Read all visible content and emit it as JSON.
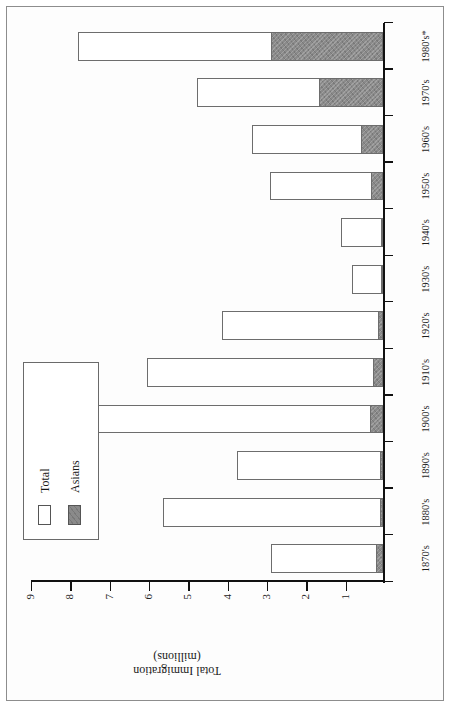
{
  "chart_data": {
    "type": "bar",
    "orientation": "rotated-90ccw",
    "title": "",
    "xlabel": "Decades",
    "ylabel": "Total Immigration (millions)",
    "ylabel_line1": "Total Immigration",
    "ylabel_line2": "(millions)",
    "ylim": [
      0,
      9
    ],
    "ytick_labels": [
      "9",
      "8",
      "7",
      "6",
      "5",
      "4",
      "3",
      "2",
      "1"
    ],
    "ytick_values": [
      9,
      8,
      7,
      6,
      5,
      4,
      3,
      2,
      1
    ],
    "grid": false,
    "legend_position": "top-left",
    "categories": [
      "1870's",
      "1880's",
      "1890's",
      "1900's",
      "1910's",
      "1920's",
      "1930's",
      "1940's",
      "1950's",
      "1960's",
      "1970's",
      "1980's*"
    ],
    "series": [
      {
        "name": "Total",
        "color": "#ffffff",
        "values": [
          2.84,
          5.6,
          3.72,
          8.8,
          6.0,
          4.1,
          0.78,
          1.06,
          2.87,
          3.32,
          4.73,
          7.75
        ]
      },
      {
        "name": "Asians",
        "color": "#8a8a8a",
        "values": [
          0.18,
          0.07,
          0.08,
          0.32,
          0.25,
          0.13,
          0.02,
          0.04,
          0.31,
          0.57,
          1.63,
          2.84
        ]
      }
    ],
    "note": "Asians segment is drawn stacked at the base of each Total bar",
    "legend": [
      {
        "label": "Total",
        "swatch": "white-square"
      },
      {
        "label": "Asians",
        "swatch": "gray-square"
      }
    ]
  }
}
